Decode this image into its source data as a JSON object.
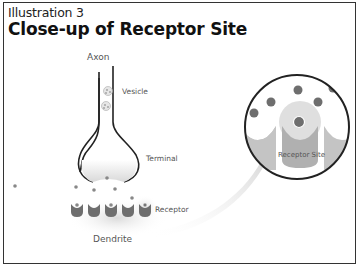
{
  "header": {
    "subtitle": "Illustration 3",
    "title": "Close-up of Receptor Site"
  },
  "labels": {
    "axon": "Axon",
    "vesicle": "Vesicle",
    "terminal": "Terminal",
    "receptor": "Receptor",
    "dendrite": "Dendrite",
    "receptor_site": "Receptor Site"
  },
  "colors": {
    "outline": "#222222",
    "receptor_dark": "#6e6e6e",
    "receptor_light": "#c4c4c4",
    "molecule": "#777777",
    "glow": "#d8d8d8",
    "arrow": "#dcdcdc"
  }
}
